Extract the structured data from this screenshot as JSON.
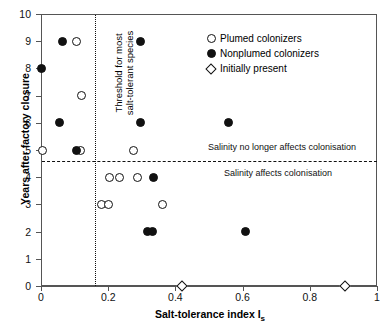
{
  "chart_data": {
    "type": "scatter",
    "title": "",
    "xlabel": "Salt-tolerance index I",
    "xlabel_sub": "s",
    "ylabel": "Years after factory closure",
    "xlim": [
      0,
      1
    ],
    "ylim": [
      0,
      10
    ],
    "xticks": [
      0,
      0.2,
      0.4,
      0.6,
      0.8,
      1
    ],
    "xticklabels": [
      "0",
      "0.2",
      "0.4",
      "0.6",
      "0.8",
      "1"
    ],
    "yticks": [
      0,
      1,
      2,
      3,
      4,
      5,
      6,
      7,
      8,
      9,
      10
    ],
    "yticklabels": [
      "0",
      "1",
      "2",
      "3",
      "4",
      "5",
      "6",
      "7",
      "8",
      "9",
      "10"
    ],
    "grid": false,
    "legend_position": "top-right",
    "series": [
      {
        "name": "Plumed colonizers",
        "marker": "open-circle",
        "points": [
          {
            "x": 0.105,
            "y": 9
          },
          {
            "x": 0.12,
            "y": 7
          },
          {
            "x": 0.003,
            "y": 5
          },
          {
            "x": 0.118,
            "y": 5
          },
          {
            "x": 0.275,
            "y": 5
          },
          {
            "x": 0.205,
            "y": 4
          },
          {
            "x": 0.235,
            "y": 4
          },
          {
            "x": 0.288,
            "y": 4
          },
          {
            "x": 0.18,
            "y": 3
          },
          {
            "x": 0.2,
            "y": 3
          },
          {
            "x": 0.363,
            "y": 3
          }
        ]
      },
      {
        "name": "Nonplumed colonizers",
        "marker": "filled-circle",
        "points": [
          {
            "x": 0.065,
            "y": 9
          },
          {
            "x": 0.295,
            "y": 9
          },
          {
            "x": 0.0,
            "y": 8
          },
          {
            "x": 0.055,
            "y": 6
          },
          {
            "x": 0.295,
            "y": 6
          },
          {
            "x": 0.558,
            "y": 6
          },
          {
            "x": 0.105,
            "y": 5
          },
          {
            "x": 0.335,
            "y": 4
          },
          {
            "x": 0.318,
            "y": 2
          },
          {
            "x": 0.332,
            "y": 2
          },
          {
            "x": 0.608,
            "y": 2
          }
        ]
      },
      {
        "name": "Initially present",
        "marker": "open-diamond",
        "points": [
          {
            "x": 0.42,
            "y": 0
          },
          {
            "x": 0.905,
            "y": 0
          }
        ]
      }
    ],
    "reference_lines": [
      {
        "name": "salt-tolerance-threshold",
        "orientation": "vertical",
        "value": 0.16,
        "style": "dotted",
        "label": "Threshold for most salt-tolerant species"
      },
      {
        "name": "salinity-effect-threshold",
        "orientation": "horizontal",
        "value": 4.6,
        "style": "dashed"
      }
    ],
    "annotations": [
      {
        "name": "note-above-line",
        "text": "Salinity no longer affects colonisation"
      },
      {
        "name": "note-below-line",
        "text": "Salinity affects colonisation"
      }
    ]
  },
  "legend": {
    "items": [
      {
        "label": "Plumed colonizers",
        "marker": "open-circle"
      },
      {
        "label": "Nonplumed colonizers",
        "marker": "filled-circle"
      },
      {
        "label": "Initially present",
        "marker": "open-diamond"
      }
    ]
  },
  "threshold_label_line1": "Threshold for most",
  "threshold_label_line2": "salt-tolerant species",
  "colors": {
    "axis": "#555555",
    "marker": "#111111",
    "background": "#ffffff"
  }
}
